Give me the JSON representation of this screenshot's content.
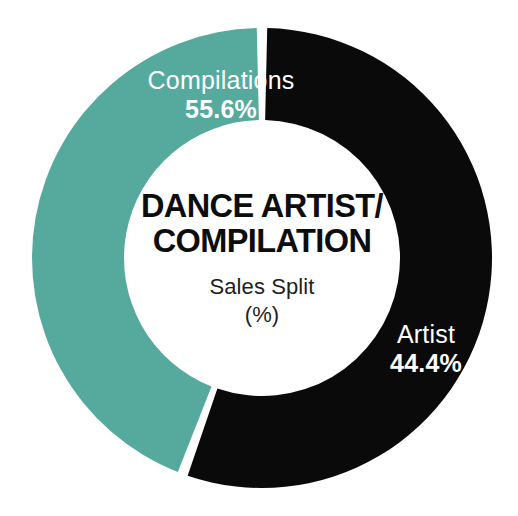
{
  "chart_data": {
    "type": "pie",
    "variant": "donut",
    "title": "DANCE ARTIST/ COMPILATION",
    "title_line1": "DANCE ARTIST/",
    "title_line2": "COMPILATION",
    "subtitle": "Sales Split",
    "unit_label": "(%)",
    "xlabel": "",
    "ylabel": "",
    "legend_position": "on-slice",
    "grid": false,
    "categories": [
      "Compilations",
      "Artist"
    ],
    "values": [
      55.6,
      44.4
    ],
    "value_labels": [
      "55.6%",
      "44.4%"
    ],
    "colors": [
      "#0a0a0a",
      "#56aa9d"
    ],
    "slices": [
      {
        "name": "Compilations",
        "value": 55.6,
        "value_label": "55.6%",
        "color": "#0a0a0a",
        "label_color": "#ffffff"
      },
      {
        "name": "Artist",
        "value": 44.4,
        "value_label": "44.4%",
        "color": "#56aa9d",
        "label_color": "#ffffff"
      }
    ]
  },
  "center": {
    "title_line1": "DANCE ARTIST/",
    "title_line2": "COMPILATION",
    "subtitle": "Sales Split",
    "unit": "(%)"
  },
  "labels": {
    "compilations": {
      "name": "Compilations",
      "value": "55.6%"
    },
    "artist": {
      "name": "Artist",
      "value": "44.4%"
    }
  },
  "theme": {
    "background": "#ffffff",
    "segment_black": "#0a0a0a",
    "segment_teal": "#56aa9d",
    "label_text": "#ffffff",
    "title_text": "#0d0d0d",
    "subtitle_text": "#1e1e1e"
  }
}
